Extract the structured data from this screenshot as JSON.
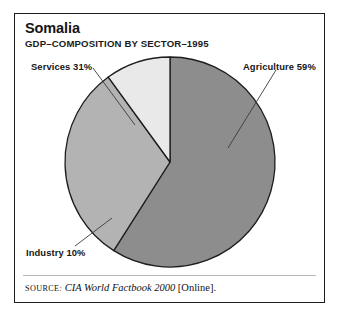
{
  "figure": {
    "title": "Somalia",
    "subtitle": "GDP–COMPOSITION BY SECTOR–1995"
  },
  "source": {
    "label": "SOURCE:",
    "work": "CIA World Factbook 2000",
    "suffix": "[Online]."
  },
  "labels": {
    "services": "Services 31%",
    "agriculture": "Agriculture 59%",
    "industry": "Industry 10%"
  },
  "colors": {
    "agriculture": "#8d8d8d",
    "services": "#b3b3b3",
    "industry": "#e9e9e9",
    "outline": "#1d1d1d",
    "frame": "#1d1d1d",
    "leader": "#3a3a3a",
    "rule": "#b9b9b9"
  },
  "chart_data": {
    "type": "pie",
    "title": "Somalia",
    "subtitle": "GDP–COMPOSITION BY SECTOR–1995",
    "xlabel": "",
    "ylabel": "",
    "units": "percent of GDP",
    "year": 1995,
    "legend": "none",
    "grid": false,
    "start_angle_deg": 0,
    "direction": "clockwise",
    "center": [
      170,
      162
    ],
    "radius": 105,
    "categories": [
      "Agriculture",
      "Services",
      "Industry"
    ],
    "values": [
      59,
      31,
      10
    ],
    "slices": [
      {
        "name": "Agriculture",
        "value": 59,
        "label": "Agriculture 59%",
        "color": "#8d8d8d",
        "start_deg": 0,
        "end_deg": 212.4
      },
      {
        "name": "Services",
        "value": 31,
        "label": "Services 31%",
        "color": "#b3b3b3",
        "start_deg": 212.4,
        "end_deg": 324.0
      },
      {
        "name": "Industry",
        "value": 10,
        "label": "Industry 10%",
        "color": "#e9e9e9",
        "start_deg": 324.0,
        "end_deg": 360.0
      }
    ],
    "total": 100,
    "annotations": [
      "SOURCE: CIA World Factbook 2000 [Online]."
    ]
  }
}
